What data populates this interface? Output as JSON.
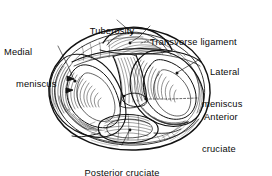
{
  "figure": {
    "ink_color": "#121212",
    "background_color": "#ffffff",
    "labels": {
      "tuberosity": {
        "lines": [
          "Tuberosity"
        ]
      },
      "transverse_ligament": {
        "lines": [
          "Transverse ligament"
        ]
      },
      "medial_meniscus": {
        "lines": [
          "Medial",
          "meniscus"
        ]
      },
      "lateral_meniscus": {
        "lines": [
          "Lateral",
          "meniscus"
        ]
      },
      "anterior_cruciate_ligament": {
        "lines": [
          "Anterior",
          "cruciate",
          "ligament"
        ]
      },
      "posterior_cruciate_ligament": {
        "lines": [
          "Posterior cruciate",
          "ligament"
        ]
      }
    }
  }
}
